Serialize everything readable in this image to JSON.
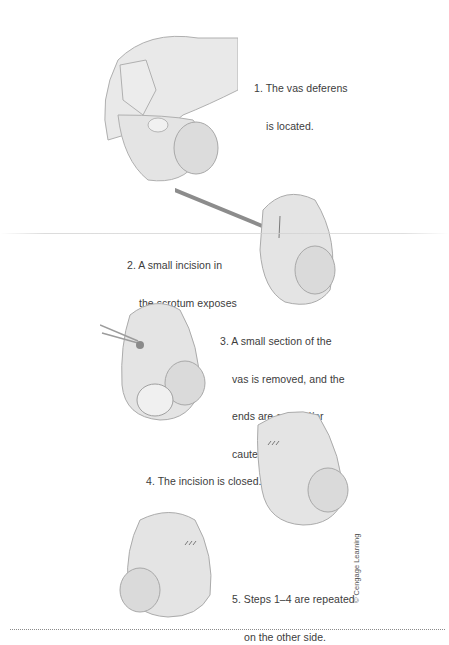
{
  "figure": {
    "colors": {
      "skin_fill": "#e6e6e6",
      "skin_shade": "#d6d6d6",
      "outline": "#a9a9a9",
      "text": "#3c3c3c",
      "instrument": "#8c8c8c"
    },
    "steps": [
      {
        "number": "1.",
        "lines": [
          "The vas deferens",
          "is located."
        ],
        "illustration": "hand-locating-vas-illustration"
      },
      {
        "number": "2.",
        "lines": [
          "A small incision in",
          "the scrotum exposes",
          "the vas."
        ],
        "illustration": "scalpel-incision-illustration"
      },
      {
        "number": "3.",
        "lines": [
          "A small section of the",
          "vas is removed, and the",
          "ends are cut and/or",
          "cauterized."
        ],
        "illustration": "vas-section-removed-illustration"
      },
      {
        "number": "4.",
        "lines": [
          "The incision is closed."
        ],
        "illustration": "incision-closed-illustration"
      },
      {
        "number": "5.",
        "lines": [
          "Steps 1–4 are repeated",
          "on the other side."
        ],
        "illustration": "other-side-illustration"
      }
    ],
    "credit": "© Cengage Learning"
  }
}
